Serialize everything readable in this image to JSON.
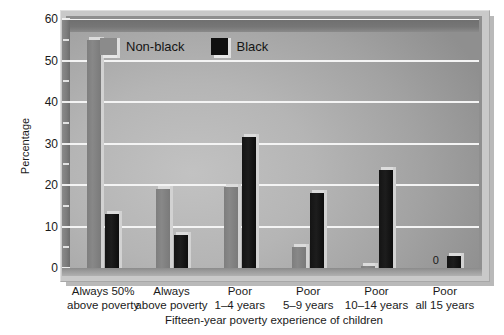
{
  "chart_data": {
    "type": "bar",
    "title": "",
    "xlabel": "Fifteen-year poverty experience of children",
    "ylabel": "Percentage",
    "ylim": [
      0,
      60
    ],
    "ytick_step": 10,
    "yminor_step": 5,
    "grid": "horizontal",
    "legend_position": "top-left-inside",
    "categories": [
      "Always 50%\nabove poverty",
      "Always\nabove poverty",
      "Poor\n1–4 years",
      "Poor\n5–9 years",
      "Poor\n10–14 years",
      "Poor\nall 15 years"
    ],
    "category_lines": [
      [
        "Always 50%",
        "above poverty"
      ],
      [
        "Always",
        "above poverty"
      ],
      [
        "Poor",
        "1–4 years"
      ],
      [
        "Poor",
        "5–9 years"
      ],
      [
        "Poor",
        "10–14 years"
      ],
      [
        "Poor",
        "all 15 years"
      ]
    ],
    "yticks": [
      0,
      10,
      20,
      30,
      40,
      50,
      60
    ],
    "ytick_labels": [
      "0",
      "10",
      "20",
      "30",
      "40",
      "50",
      "60"
    ],
    "series": [
      {
        "name": "Non-black",
        "color": "#828282",
        "values": [
          55,
          19,
          19.5,
          5,
          0.5,
          0
        ],
        "data_labels": [
          "",
          "",
          "",
          "",
          "",
          "0"
        ]
      },
      {
        "name": "Black",
        "color": "#101010",
        "values": [
          13,
          8,
          31.5,
          18,
          23.5,
          3
        ],
        "data_labels": [
          "",
          "",
          "",
          "",
          "",
          ""
        ]
      }
    ]
  },
  "legend": {
    "items": [
      {
        "label": "Non-black",
        "swatch": "nonblack"
      },
      {
        "label": "Black",
        "swatch": "black"
      }
    ]
  },
  "axes": {
    "y_title": "Percentage",
    "x_title": "Fifteen-year poverty experience of children"
  }
}
